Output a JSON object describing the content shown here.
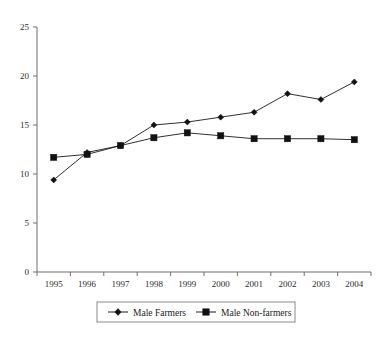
{
  "chart_data": {
    "type": "line",
    "title": "",
    "xlabel": "",
    "ylabel": "",
    "categories": [
      "1995",
      "1996",
      "1997",
      "1998",
      "1999",
      "2000",
      "2001",
      "2002",
      "2003",
      "2004"
    ],
    "x": [
      1995,
      1996,
      1997,
      1998,
      1999,
      2000,
      2001,
      2002,
      2003,
      2004
    ],
    "series": [
      {
        "name": "Male Farmers",
        "marker": "diamond",
        "values": [
          9.4,
          12.2,
          12.9,
          15.0,
          15.3,
          15.8,
          16.3,
          18.2,
          17.6,
          19.4
        ]
      },
      {
        "name": "Male Non-farmers",
        "marker": "square",
        "values": [
          11.7,
          12.0,
          12.9,
          13.7,
          14.2,
          13.9,
          13.6,
          13.6,
          13.6,
          13.5
        ]
      }
    ],
    "ylim": [
      0,
      25
    ],
    "yticks": [
      0,
      5,
      10,
      15,
      20,
      25
    ],
    "ytick_labels": [
      "0",
      "5",
      "10",
      "15",
      "20",
      "25"
    ],
    "xtick_labels": [
      "1995",
      "1996",
      "1997",
      "1998",
      "1999",
      "2000",
      "2001",
      "2002",
      "2003",
      "2004"
    ],
    "grid": false,
    "legend_position": "bottom",
    "legend": [
      "Male Farmers",
      "Male Non-farmers"
    ],
    "colors": {
      "line": "#1a1a1a",
      "axis": "#6f6f6f",
      "text": "#1a1a1a",
      "background": "#ffffff"
    }
  }
}
